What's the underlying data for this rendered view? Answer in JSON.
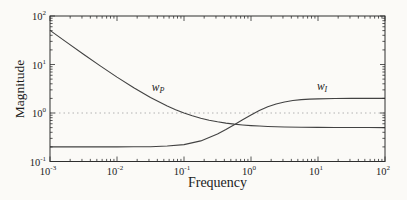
{
  "figure": {
    "background": "#fbfaf7",
    "frame_color": "#2e2e2e",
    "curve_color": "#424242",
    "ref_line_color": "#b2b2b2",
    "text_color": "#1c1c1c"
  },
  "chart_data": {
    "type": "line",
    "title": "",
    "xlabel": "Frequency",
    "ylabel": "Magnitude",
    "x_scale": "log",
    "y_scale": "log",
    "xlim": [
      0.001,
      100
    ],
    "ylim": [
      0.1,
      100
    ],
    "x_tick_exponents": [
      -3,
      -2,
      -1,
      0,
      1,
      2
    ],
    "y_tick_exponents": [
      -1,
      0,
      1,
      2
    ],
    "grid": false,
    "legend_position": "none",
    "reference_lines": [
      {
        "y": 1,
        "style": "dotted"
      }
    ],
    "series": [
      {
        "name": "wP",
        "label_main": "w",
        "label_sub": "P",
        "label_anchor": {
          "freq": 0.041,
          "mag": 2.9
        },
        "points": [
          [
            0.001,
            50.5
          ],
          [
            0.00178,
            28.6
          ],
          [
            0.00316,
            16.3
          ],
          [
            0.00562,
            9.39
          ],
          [
            0.01,
            5.5
          ],
          [
            0.0178,
            3.31
          ],
          [
            0.0316,
            2.08
          ],
          [
            0.0562,
            1.39
          ],
          [
            0.075,
            1.17
          ],
          [
            0.1,
            1.0
          ],
          [
            0.133,
            0.876
          ],
          [
            0.178,
            0.781
          ],
          [
            0.237,
            0.711
          ],
          [
            0.316,
            0.658
          ],
          [
            0.422,
            0.619
          ],
          [
            0.562,
            0.589
          ],
          [
            0.75,
            0.567
          ],
          [
            1,
            0.55
          ],
          [
            1.33,
            0.538
          ],
          [
            1.78,
            0.528
          ],
          [
            3.16,
            0.516
          ],
          [
            5.62,
            0.509
          ],
          [
            10,
            0.505
          ],
          [
            17.8,
            0.503
          ],
          [
            31.6,
            0.502
          ],
          [
            56.2,
            0.501
          ],
          [
            100,
            0.5
          ]
        ]
      },
      {
        "name": "wI",
        "label_main": "w",
        "label_sub": "I",
        "label_anchor": {
          "freq": 11.5,
          "mag": 2.95
        },
        "points": [
          [
            0.001,
            0.2
          ],
          [
            0.00316,
            0.2
          ],
          [
            0.01,
            0.2
          ],
          [
            0.0178,
            0.201
          ],
          [
            0.0316,
            0.202
          ],
          [
            0.0562,
            0.208
          ],
          [
            0.1,
            0.223
          ],
          [
            0.178,
            0.266
          ],
          [
            0.316,
            0.369
          ],
          [
            0.422,
            0.457
          ],
          [
            0.562,
            0.575
          ],
          [
            0.75,
            0.727
          ],
          [
            1,
            0.912
          ],
          [
            1.33,
            1.12
          ],
          [
            1.78,
            1.34
          ],
          [
            2.37,
            1.53
          ],
          [
            3.16,
            1.69
          ],
          [
            4.22,
            1.81
          ],
          [
            5.62,
            1.89
          ],
          [
            7.5,
            1.93
          ],
          [
            10,
            1.96
          ],
          [
            17.8,
            1.99
          ],
          [
            31.6,
            2.0
          ],
          [
            56.2,
            2.0
          ],
          [
            100,
            2.0
          ]
        ]
      }
    ]
  }
}
